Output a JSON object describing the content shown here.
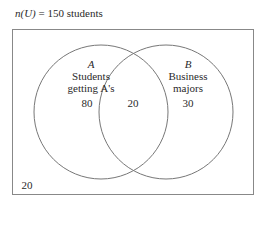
{
  "title": {
    "prefix": "n(U)",
    "rest": " = 150 students"
  },
  "universe": {
    "total": 150,
    "outside_value": "20"
  },
  "sets": [
    {
      "name": "A",
      "description_line1": "Students",
      "description_line2": "getting A's",
      "only_value": "80"
    },
    {
      "name": "B",
      "description_line1": "Business",
      "description_line2": "majors",
      "only_value": "30"
    }
  ],
  "intersection_value": "20",
  "colors": {
    "stroke": "#777777",
    "text": "#2a2a2a",
    "background": "#ffffff"
  }
}
